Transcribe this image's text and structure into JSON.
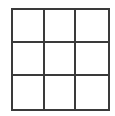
{
  "grid": {
    "rows": 3,
    "cols": 3,
    "line_color": "#3a3a3a",
    "background": "#ffffff",
    "cells": [
      [
        "",
        "",
        ""
      ],
      [
        "",
        "",
        ""
      ],
      [
        "",
        "",
        ""
      ]
    ]
  }
}
